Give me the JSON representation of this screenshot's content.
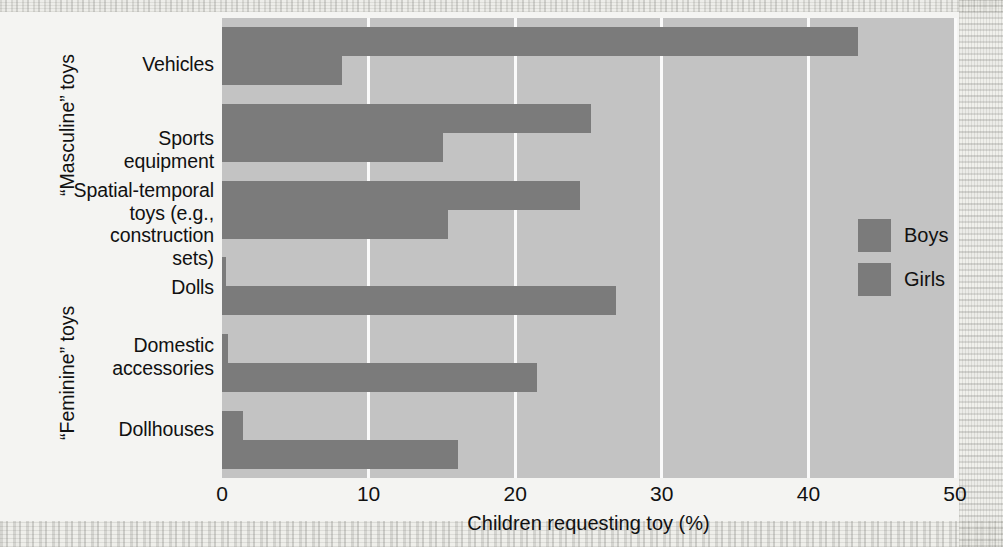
{
  "chart_data": {
    "type": "bar",
    "orientation": "horizontal",
    "title": "",
    "xlabel": "Children requesting toy (%)",
    "ylabel": "",
    "xlim": [
      0,
      50
    ],
    "xticks": [
      0,
      10,
      20,
      30,
      40,
      50
    ],
    "xtick_labels": [
      "0",
      "10",
      "20",
      "30",
      "40",
      "50"
    ],
    "grid": true,
    "legend_position": "right-middle",
    "categories": [
      "Vehicles",
      "Sports equipment",
      "Spatial-temporal toys (e.g., construction sets)",
      "Dolls",
      "Domestic accessories",
      "Dollhouses"
    ],
    "series": [
      {
        "name": "Boys",
        "values": [
          43.4,
          25.2,
          24.4,
          0.3,
          0.4,
          1.4
        ]
      },
      {
        "name": "Girls",
        "values": [
          8.2,
          15.1,
          15.4,
          26.9,
          21.5,
          16.1
        ]
      }
    ],
    "group_labels": [
      {
        "text": "“Masculine” toys",
        "categories": [
          "Vehicles",
          "Sports equipment",
          "Spatial-temporal toys (e.g., construction sets)"
        ]
      },
      {
        "text": "“Feminine” toys",
        "categories": [
          "Dolls",
          "Domestic accessories",
          "Dollhouses"
        ]
      }
    ],
    "colors": {
      "bar": "#7b7b7b",
      "plot_background": "#c3c3c3",
      "gridline": "#fafafa",
      "text": "#111111",
      "page_background": "#f4f4f2"
    }
  },
  "category_label_lines": [
    [
      "Vehicles"
    ],
    [
      "Sports",
      "equipment"
    ],
    [
      "Spatial-temporal",
      "toys (e.g.,",
      "construction",
      "sets)"
    ],
    [
      "Dolls"
    ],
    [
      "Domestic",
      "accessories"
    ],
    [
      "Dollhouses"
    ]
  ],
  "legend": {
    "items": [
      {
        "label": "Boys",
        "color": "#7b7b7b"
      },
      {
        "label": "Girls",
        "color": "#7b7b7b"
      }
    ]
  },
  "group_label_masculine": "“Masculine” toys",
  "group_label_feminine": "“Feminine” toys",
  "xaxis_title": "Children requesting toy (%)",
  "xtick_0": "0",
  "xtick_1": "10",
  "xtick_2": "20",
  "xtick_3": "30",
  "xtick_4": "40",
  "xtick_5": "50"
}
